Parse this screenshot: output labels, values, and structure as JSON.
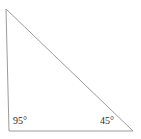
{
  "figure": {
    "type": "triangle-diagram",
    "background_color": "#ffffff",
    "stroke_color": "#9a9a9a",
    "stroke_width": 1,
    "label_color": "#2b2b2b",
    "width": 141,
    "height": 139,
    "vertices": {
      "apex": {
        "x": 6,
        "y": 9
      },
      "bottom_left": {
        "x": 9,
        "y": 131
      },
      "bottom_right": {
        "x": 133,
        "y": 131
      }
    },
    "polygon_points": "6,9 9,131 133,131",
    "labels": [
      {
        "name": "angle-label-bottom-left",
        "text": "95°",
        "value": 95,
        "unit": "degrees",
        "at_vertex": "bottom_left"
      },
      {
        "name": "angle-label-bottom-right",
        "text": "45°",
        "value": 45,
        "unit": "degrees",
        "at_vertex": "bottom_right"
      }
    ]
  }
}
